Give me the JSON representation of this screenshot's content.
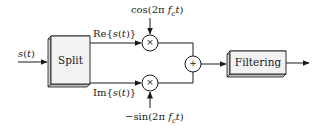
{
  "diagram": {
    "input_label": {
      "base": "s",
      "arg": "(t)"
    },
    "blocks": [
      {
        "id": "split",
        "label": "Split"
      },
      {
        "id": "filtering",
        "label": "Filtering"
      }
    ],
    "branches": {
      "top": {
        "prefix": "Re{",
        "sig": "s",
        "arg": "(t)",
        "suffix": "}"
      },
      "bottom": {
        "prefix": "Im{",
        "sig": "s",
        "arg": "(t)",
        "suffix": "}"
      }
    },
    "carriers": {
      "top": {
        "pre": "cos(2π ",
        "f": "f",
        "sub": "c",
        "t": "t",
        "post": ")"
      },
      "bottom": {
        "pre": "−sin(2π ",
        "f": "f",
        "sub": "c",
        "t": "t",
        "post": ")"
      }
    },
    "operators": {
      "multiply": "×",
      "add": "+"
    },
    "colors": {
      "line": "#1a1a1a",
      "box_face": "#f2f2f2",
      "box_side": "#cfcfcf"
    }
  }
}
